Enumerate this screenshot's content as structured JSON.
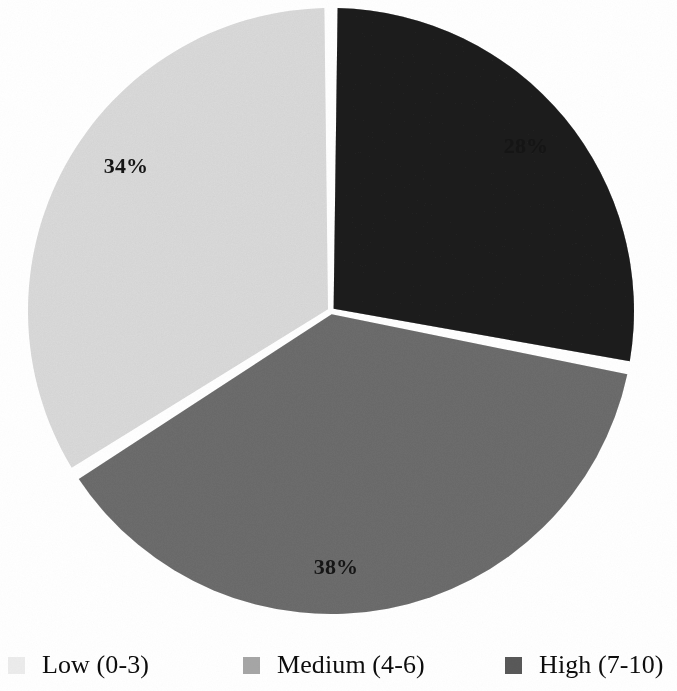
{
  "chart_data": {
    "type": "pie",
    "title": "",
    "subtitle": "",
    "xlabel": "",
    "ylabel": "",
    "grid": false,
    "legend_position": "bottom",
    "start_angle_deg": 0,
    "direction": "clockwise",
    "categories": [
      "High (7-10)",
      "Medium (4-6)",
      "Low (0-3)"
    ],
    "values": [
      28,
      38,
      34
    ],
    "value_unit": "%",
    "slices": [
      {
        "key": "high",
        "name": "High (7-10)",
        "value": 28,
        "label": "28%",
        "color": "#595959"
      },
      {
        "key": "medium",
        "name": "Medium (4-6)",
        "value": 38,
        "label": "38%",
        "color": "#a6a6a6"
      },
      {
        "key": "low",
        "name": "Low (0-3)",
        "value": 34,
        "label": "34%",
        "color": "#ececec"
      }
    ],
    "legend": [
      {
        "key": "low",
        "label": "Low (0-3)",
        "color": "#ececec"
      },
      {
        "key": "medium",
        "label": "Medium (4-6)",
        "color": "#a6a6a6"
      },
      {
        "key": "high",
        "label": "High (7-10)",
        "color": "#595959"
      }
    ],
    "colors": {
      "low": "#ececec",
      "medium": "#a6a6a6",
      "high": "#595959",
      "background": "#ffffff",
      "separator": "#ffffff",
      "label_text": "#151515"
    }
  }
}
